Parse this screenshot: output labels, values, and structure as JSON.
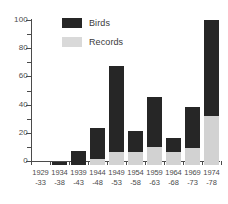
{
  "chart_data": {
    "type": "bar",
    "title": "",
    "xlabel": "",
    "ylabel": "",
    "ylim": [
      0,
      100
    ],
    "yticks": [
      0,
      20,
      40,
      60,
      80,
      100
    ],
    "ytick_labels": [
      "0",
      "20",
      "40",
      "60",
      "80",
      "100"
    ],
    "minor_yticks": [
      10,
      30,
      50,
      70,
      90
    ],
    "grid": false,
    "stacked": true,
    "legend_position": "top-left-inside",
    "categories": [
      "1929 -33",
      "1934 -38",
      "1939 -43",
      "1944 -48",
      "1949 -53",
      "1954 -58",
      "1959 -63",
      "1964 -68",
      "1969 -73",
      "1974 -78"
    ],
    "category_lines": [
      [
        "1929",
        "-33"
      ],
      [
        "1934",
        "-38"
      ],
      [
        "1939",
        "-43"
      ],
      [
        "1944",
        "-48"
      ],
      [
        "1949",
        "-53"
      ],
      [
        "1954",
        "-58"
      ],
      [
        "1959",
        "-63"
      ],
      [
        "1964",
        "-68"
      ],
      [
        "1969",
        "-73"
      ],
      [
        "1974",
        "-78"
      ]
    ],
    "series": [
      {
        "name": "Records",
        "color": "#d2d2d2",
        "values": [
          0,
          0,
          0,
          4.5,
          9,
          9,
          13,
          9.5,
          12,
          35
        ]
      },
      {
        "name": "Birds",
        "color": "#262626",
        "values": [
          0,
          2,
          10,
          26,
          70,
          24,
          48,
          19,
          41,
          103
        ]
      }
    ]
  },
  "legend": {
    "items": [
      {
        "label": "Birds",
        "swatch": "#262626"
      },
      {
        "label": "Records",
        "swatch": "#d9d9d9"
      }
    ]
  }
}
